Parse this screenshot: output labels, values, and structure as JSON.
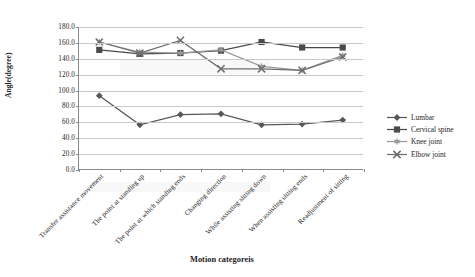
{
  "chart_data": {
    "type": "line",
    "title": "",
    "xlabel": "Motion categoreis",
    "ylabel": "Angle(degree)",
    "categories": [
      "Transfer assistance movement",
      "The point at standing up",
      "The point at which standing ends",
      "Changing direction",
      "While assisting sitting down",
      "When assisting sitting ends",
      "Readjustment of sitting"
    ],
    "ylim": [
      0,
      180
    ],
    "yticks": [
      "0.0",
      "20.0",
      "40.0",
      "60.0",
      "80.0",
      "100.0",
      "120.0",
      "140.0",
      "160.0",
      "180.0"
    ],
    "ytick_values": [
      0,
      20,
      40,
      60,
      80,
      100,
      120,
      140,
      160,
      180
    ],
    "grid": true,
    "legend_position": "right",
    "series": [
      {
        "name": "Lumbar",
        "marker": "diamond",
        "color": "#585858",
        "values": [
          93,
          56,
          69,
          70,
          56,
          57,
          62
        ]
      },
      {
        "name": "Cervical spine",
        "marker": "square",
        "color": "#4a4a4a",
        "values": [
          151,
          146,
          147,
          150,
          161,
          154,
          154
        ]
      },
      {
        "name": "Knee joint",
        "marker": "star",
        "color": "#9a9a9a",
        "values": [
          161,
          148,
          147,
          151,
          130,
          125,
          144
        ]
      },
      {
        "name": "Elbow joint",
        "marker": "cross",
        "color": "#6e6e6e",
        "values": [
          161,
          147,
          163,
          127,
          127,
          125,
          142
        ]
      }
    ]
  },
  "legend": {
    "items": [
      {
        "label": "Lumbar"
      },
      {
        "label": "Cervical spine"
      },
      {
        "label": "Knee joint"
      },
      {
        "label": "Elbow joint"
      }
    ]
  }
}
